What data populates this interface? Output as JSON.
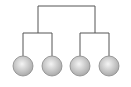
{
  "diagram": {
    "type": "binary-tree",
    "line_color": "#555555",
    "node_fill_light": "#f2f2f2",
    "node_fill_dark": "#b0b0b0",
    "node_stroke": "#888888",
    "nodes": [
      {
        "id": "leaf-1",
        "cx": 23,
        "cy": 66
      },
      {
        "id": "leaf-2",
        "cx": 52,
        "cy": 66
      },
      {
        "id": "leaf-3",
        "cx": 80,
        "cy": 66
      },
      {
        "id": "leaf-4",
        "cx": 109,
        "cy": 66
      }
    ]
  }
}
